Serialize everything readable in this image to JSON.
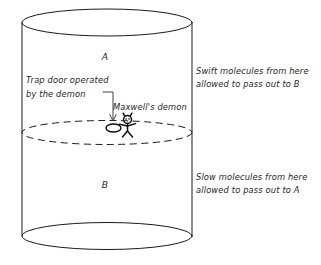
{
  "diagram": {
    "background_color": "#ffffff",
    "ink_color": "#1a1a1a",
    "chamber_upper_label": "A",
    "chamber_lower_label": "B",
    "annotations": {
      "trap_door_line1": "Trap door operated",
      "trap_door_line2": "by the demon",
      "demon_label": "Maxwell's demon",
      "upper_note_line1": "Swift molecules from here",
      "upper_note_line2": "allowed to pass out to B",
      "lower_note_line1": "Slow molecules from here",
      "lower_note_line2": "allowed to pass out to A"
    },
    "icons": {
      "demon": "stick-figure-demon-icon",
      "trap_door": "trap-door-ellipse-icon",
      "pointer": "leader-arrow-icon",
      "partition": "dashed-partition-ellipse-icon",
      "cylinder": "cylinder-vessel-icon"
    }
  }
}
